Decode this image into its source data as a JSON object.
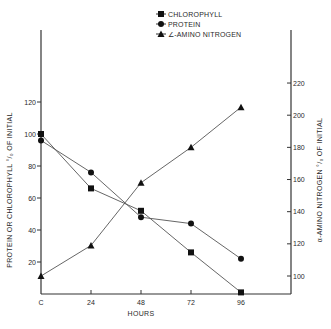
{
  "chart_data": {
    "type": "line",
    "title": "",
    "xlabel": "HOURS",
    "ylabel": "PROTEIN OR CHLOROPHYLL % OF INITIAL",
    "ylabel_right": "α-AMINO NITROGEN % OF INITIAL",
    "x": [
      0,
      24,
      48,
      72,
      96
    ],
    "x_tick_labels": [
      "C",
      "24",
      "48",
      "72",
      "96"
    ],
    "y_ticks_left": [
      20,
      40,
      60,
      80,
      100,
      120
    ],
    "y_ticks_right": [
      100,
      120,
      140,
      160,
      180,
      200,
      220
    ],
    "ylim_left": [
      0,
      140
    ],
    "ylim_right": [
      89,
      230
    ],
    "grid": false,
    "legend_position": "top-right",
    "series": [
      {
        "name": "CHLOROPHYLL",
        "marker": "square",
        "axis": "left",
        "values": [
          100,
          66,
          52,
          26,
          1
        ]
      },
      {
        "name": "PROTEIN",
        "marker": "circle",
        "axis": "left",
        "values": [
          96,
          76,
          48,
          44,
          22
        ]
      },
      {
        "name": "α-AMINO NITROGEN",
        "marker": "triangle",
        "axis": "right",
        "values": [
          100,
          119,
          158,
          180,
          205
        ]
      }
    ]
  },
  "labels": {
    "xlabel": "HOURS",
    "ylabel_left": "PROTEIN OR CHLOROPHYLL  °/₀ OF INITIAL",
    "ylabel_right": "α-AMINO NITROGEN °/₀ OF INITIAL",
    "legend": [
      "CHLOROPHYLL",
      "PROTEIN",
      "∠-AMINO  NITROGEN"
    ]
  }
}
